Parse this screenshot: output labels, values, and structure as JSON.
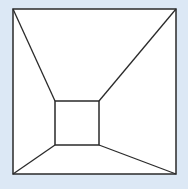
{
  "diagram": {
    "type": "perspective-room",
    "background": "#dce8f5",
    "fill": "#ffffff",
    "stroke": "#2a2a2a",
    "outer_square": {
      "x1": 13,
      "y1": 9,
      "x2": 176,
      "y2": 174
    },
    "inner_square": {
      "x1": 55,
      "y1": 101,
      "x2": 99,
      "y2": 145
    }
  }
}
